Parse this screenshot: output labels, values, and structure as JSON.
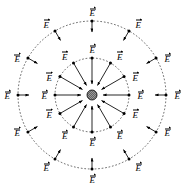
{
  "figure": {
    "width": 183,
    "height": 187,
    "background_color": "#ffffff",
    "ink_color": "#000000",
    "center": {
      "x": 92,
      "y": 95
    },
    "charge": {
      "name": "point-charge",
      "sign": "negative",
      "radius": 5,
      "fill": "#8c8c8c",
      "stroke": "#000000"
    },
    "rings": [
      {
        "name": "inner-ring",
        "radius": 37,
        "style": "dotted",
        "dot_radius": 1.5,
        "arrow_length": 26
      },
      {
        "name": "outer-ring",
        "radius": 74,
        "style": "dotted",
        "dot_radius": 1.5,
        "arrow_length": 11
      }
    ],
    "vector_symbol": "E",
    "vector_direction": "inward",
    "vectors_per_ring": 12,
    "angles_deg": [
      90,
      120,
      150,
      180,
      210,
      240,
      270,
      300,
      330,
      0,
      30,
      60
    ]
  },
  "chart_data": {
    "type": "scatter",
    "xlabel": "",
    "ylabel": "",
    "legend": [],
    "series": [
      {
        "name": "inner-ring-vectors",
        "radius": 37,
        "label": "E",
        "direction": "inward",
        "points": [
          {
            "angle_deg": 90,
            "label": "E",
            "label_pos": "above"
          },
          {
            "angle_deg": 60,
            "label": "E",
            "label_pos": "above-right"
          },
          {
            "angle_deg": 30,
            "label": "E",
            "label_pos": "right"
          },
          {
            "angle_deg": 0,
            "label": "E",
            "label_pos": "right"
          },
          {
            "angle_deg": 330,
            "label": "E",
            "label_pos": "right"
          },
          {
            "angle_deg": 300,
            "label": "E",
            "label_pos": "below-right"
          },
          {
            "angle_deg": 270,
            "label": "E",
            "label_pos": "below"
          },
          {
            "angle_deg": 240,
            "label": "E",
            "label_pos": "below-left"
          },
          {
            "angle_deg": 210,
            "label": "E",
            "label_pos": "left"
          },
          {
            "angle_deg": 180,
            "label": "E",
            "label_pos": "left"
          },
          {
            "angle_deg": 150,
            "label": "E",
            "label_pos": "left"
          },
          {
            "angle_deg": 120,
            "label": "E",
            "label_pos": "above-left"
          }
        ]
      },
      {
        "name": "outer-ring-vectors",
        "radius": 74,
        "label": "E",
        "direction": "inward",
        "points": [
          {
            "angle_deg": 90,
            "label": "E",
            "label_pos": "above"
          },
          {
            "angle_deg": 60,
            "label": "E",
            "label_pos": "above-right"
          },
          {
            "angle_deg": 30,
            "label": "E",
            "label_pos": "right"
          },
          {
            "angle_deg": 0,
            "label": "E",
            "label_pos": "right"
          },
          {
            "angle_deg": 330,
            "label": "E",
            "label_pos": "right"
          },
          {
            "angle_deg": 300,
            "label": "E",
            "label_pos": "below-right"
          },
          {
            "angle_deg": 270,
            "label": "E",
            "label_pos": "below"
          },
          {
            "angle_deg": 240,
            "label": "E",
            "label_pos": "below-left"
          },
          {
            "angle_deg": 210,
            "label": "E",
            "label_pos": "left"
          },
          {
            "angle_deg": 180,
            "label": "E",
            "label_pos": "left"
          },
          {
            "angle_deg": 150,
            "label": "E",
            "label_pos": "left"
          },
          {
            "angle_deg": 120,
            "label": "E",
            "label_pos": "above-left"
          }
        ]
      }
    ]
  }
}
